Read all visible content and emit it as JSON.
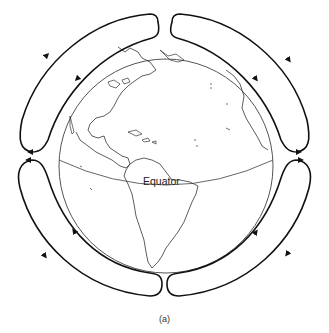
{
  "figure": {
    "caption": "(a)",
    "equator_label": "Equator",
    "colors": {
      "background": "#ffffff",
      "line": "#111111",
      "coast": "#333333",
      "globe_outline": "#555555"
    },
    "cells": [
      {
        "id": "northwest-cell",
        "quadrant": "upper-left",
        "outer_flow": "upward toward pole",
        "inner_flow": "downward toward equator"
      },
      {
        "id": "northeast-cell",
        "quadrant": "upper-right",
        "outer_flow": "downward toward equator",
        "inner_flow": "upward toward pole"
      },
      {
        "id": "southwest-cell",
        "quadrant": "lower-left",
        "outer_flow": "downward toward pole",
        "inner_flow": "upward toward equator"
      },
      {
        "id": "southeast-cell",
        "quadrant": "lower-right",
        "outer_flow": "downward toward pole",
        "inner_flow": "upward toward equator"
      }
    ]
  }
}
